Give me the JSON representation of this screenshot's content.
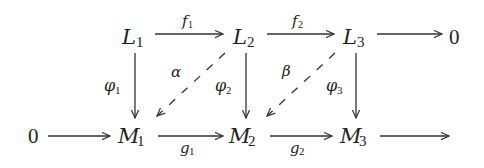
{
  "diagram": {
    "type": "commutative-diagram",
    "top_row": {
      "left_zero": "",
      "nodes": [
        {
          "id": "L1",
          "base": "L",
          "sub": "1"
        },
        {
          "id": "L2",
          "base": "L",
          "sub": "2"
        },
        {
          "id": "L3",
          "base": "L",
          "sub": "3"
        },
        {
          "id": "0top",
          "base": "0",
          "sub": ""
        }
      ]
    },
    "bottom_row": {
      "nodes": [
        {
          "id": "0bottom",
          "base": "0",
          "sub": ""
        },
        {
          "id": "M1",
          "base": "M",
          "sub": "1"
        },
        {
          "id": "M2",
          "base": "M",
          "sub": "2"
        },
        {
          "id": "M3",
          "base": "M",
          "sub": "3"
        }
      ]
    },
    "edges": {
      "f1": {
        "base": "f",
        "sub": "1",
        "from": "L1",
        "to": "L2"
      },
      "f2": {
        "base": "f",
        "sub": "2",
        "from": "L2",
        "to": "L3"
      },
      "top_zero": {
        "from": "L3",
        "to": "0top"
      },
      "phi1": {
        "base": "φ",
        "sub": "1",
        "from": "L1",
        "to": "M1"
      },
      "phi2": {
        "base": "φ",
        "sub": "2",
        "from": "L2",
        "to": "M2"
      },
      "phi3": {
        "base": "φ",
        "sub": "3",
        "from": "L3",
        "to": "M3"
      },
      "alpha": {
        "base": "α",
        "from": "L2",
        "to": "M1",
        "style": "dashed"
      },
      "beta": {
        "base": "β",
        "from": "L3",
        "to": "M2",
        "style": "dashed"
      },
      "bottom_zero": {
        "from": "0bottom",
        "to": "M1"
      },
      "g1": {
        "base": "g",
        "sub": "1",
        "from": "M1",
        "to": "M2"
      },
      "g2": {
        "base": "g",
        "sub": "2",
        "from": "M2",
        "to": "M3"
      },
      "out": {
        "from": "M3",
        "to": "(unlabeled)"
      }
    }
  }
}
